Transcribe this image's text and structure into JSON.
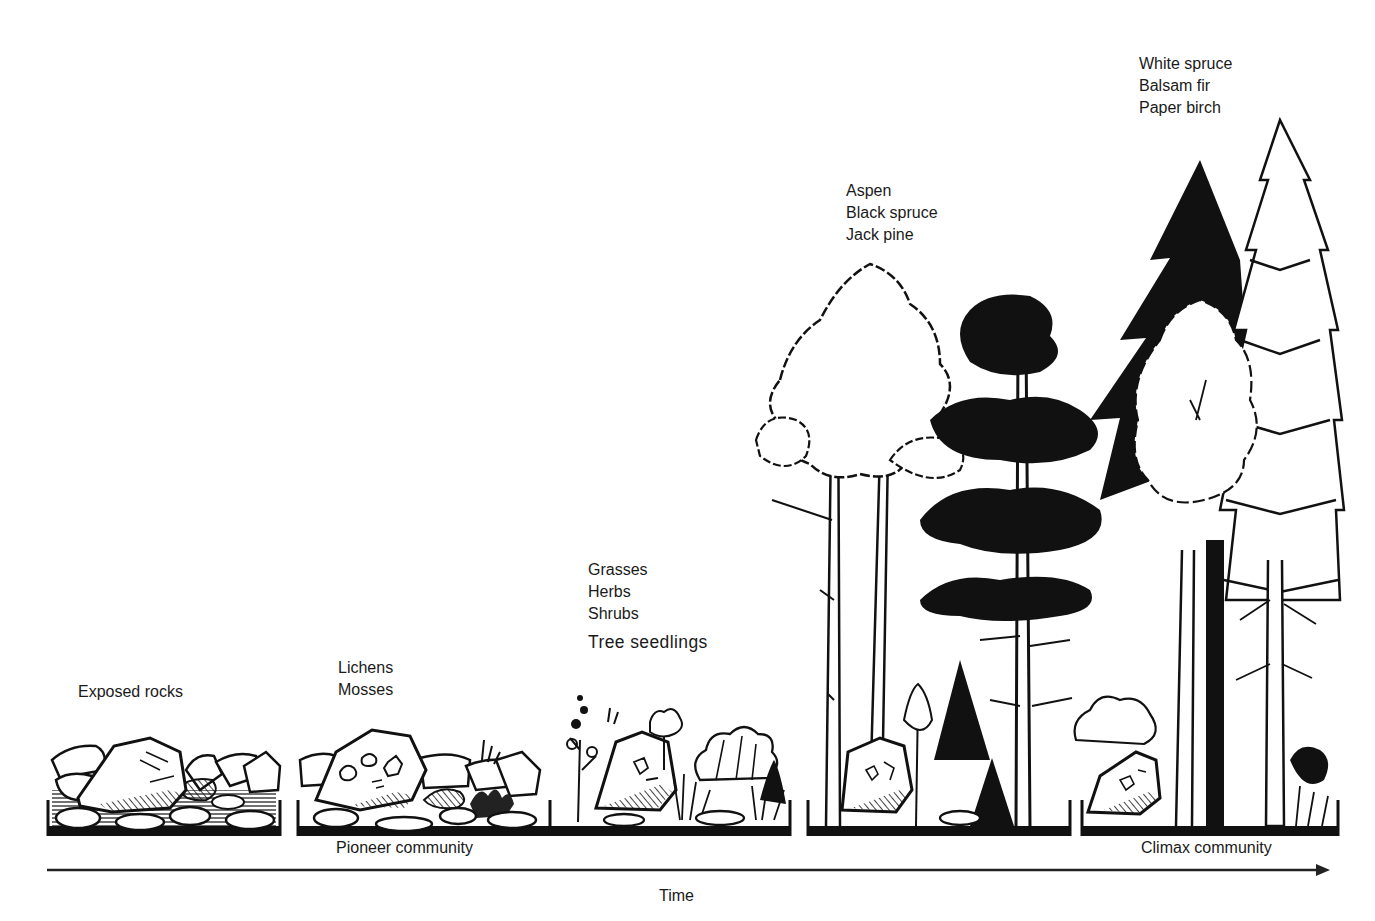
{
  "diagram": {
    "type": "ecological succession",
    "stages": [
      {
        "id": "stage-1",
        "species": [
          "Exposed rocks"
        ]
      },
      {
        "id": "stage-2",
        "species": [
          "Lichens",
          "Mosses"
        ]
      },
      {
        "id": "stage-3",
        "species": [
          "Grasses",
          "Herbs",
          "Shrubs",
          "Tree seedlings"
        ]
      },
      {
        "id": "stage-4",
        "species": [
          "Aspen",
          "Black spruce",
          "Jack pine"
        ]
      },
      {
        "id": "stage-5",
        "species": [
          "White spruce",
          "Balsam fir",
          "Paper birch"
        ]
      }
    ],
    "captions": {
      "pioneer": "Pioneer community",
      "climax": "Climax community"
    },
    "axis": {
      "label": "Time",
      "direction": "left-to-right"
    },
    "colors": {
      "ink": "#111111",
      "background": "#ffffff"
    }
  }
}
